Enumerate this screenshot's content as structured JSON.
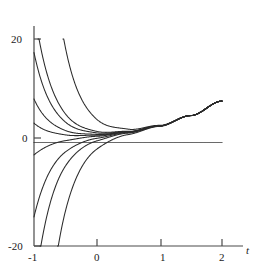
{
  "figure": {
    "kind": "solution-family-plot",
    "background": "#ffffff",
    "stroke_color": "#2b2b2b",
    "axis_color": "#4a4a4a",
    "width": 260,
    "height": 273
  },
  "axes": {
    "x_axis_label": "t",
    "y_axis_label": "",
    "x_ticks": [
      {
        "value": -1,
        "label": "-1",
        "px": 34
      },
      {
        "value": 0,
        "label": "0",
        "px": 97
      },
      {
        "value": 1,
        "label": "1",
        "px": 161
      },
      {
        "value": 2,
        "label": "2",
        "px": 222
      }
    ],
    "y_ticks": [
      {
        "value": 20,
        "label": "20",
        "px": 39
      },
      {
        "value": 0,
        "label": "0",
        "px": 138
      },
      {
        "value": -20,
        "label": "-20",
        "px": 246
      }
    ]
  },
  "chart_data": {
    "type": "line",
    "title": "",
    "subtitle": "",
    "xlabel": "t",
    "ylabel": "",
    "xlim": [
      -1,
      2
    ],
    "ylim": [
      -20,
      20
    ],
    "grid": false,
    "legend": false,
    "legend_position": "none",
    "annotations": [],
    "x_tick_labels": [
      "-1",
      "0",
      "1",
      "2"
    ],
    "y_tick_labels": [
      "20",
      "0",
      "-20"
    ],
    "model": {
      "form": "y(t) = p(t) + C*exp(-k*t)",
      "particular_solution_samples": {
        "t": [
          -1,
          -0.5,
          0,
          0.5,
          1,
          1.5,
          2
        ],
        "y": [
          0.6,
          0.9,
          1.3,
          2.0,
          3.2,
          5.2,
          8.0
        ]
      },
      "decay_rate_k": 3.4
    },
    "series": [
      {
        "name": "C = 3.2",
        "C": 3.2,
        "kind": "upper-escaping",
        "start_t": -0.52,
        "start_y": 20
      },
      {
        "name": "C = 0.85",
        "C": 0.85,
        "kind": "upper-escaping",
        "start_t": -0.1,
        "start_y": 20
      },
      {
        "name": "C = 0.56",
        "C": 0.56,
        "kind": "upper-axis",
        "start_t": -1,
        "start_y": 16.5
      },
      {
        "name": "C = 0.26",
        "C": 0.26,
        "kind": "upper-axis",
        "start_t": -1,
        "start_y": 8.2
      },
      {
        "name": "C = 0.105",
        "C": 0.105,
        "kind": "upper-axis",
        "start_t": -1,
        "start_y": 3.6
      },
      {
        "name": "C = 0",
        "C": 0,
        "kind": "horizontal-zero",
        "start_t": -1,
        "start_y": 0
      },
      {
        "name": "C = -0.1",
        "C": -0.1,
        "kind": "lower-axis",
        "start_t": -1,
        "start_y": -3.4
      },
      {
        "name": "C = -0.5",
        "C": -0.5,
        "kind": "lower-axis",
        "start_t": -1,
        "start_y": -15.9
      },
      {
        "name": "C = -1.0",
        "C": -1.0,
        "kind": "lower-escaping",
        "start_t": -0.52,
        "start_y": -20
      },
      {
        "name": "C = -2.6",
        "C": -2.6,
        "kind": "lower-escaping",
        "start_t": -0.02,
        "start_y": -20
      }
    ]
  }
}
